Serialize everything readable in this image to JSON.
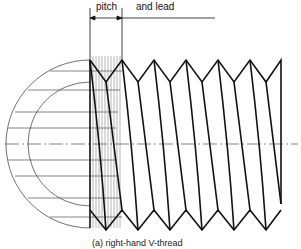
{
  "labels": {
    "pitch": "pitch",
    "and_lead": "and lead",
    "caption": "(a) right-hand V-thread"
  },
  "diagram": {
    "type": "single-start right-hand V-thread with helix projection",
    "colors": {
      "line": "#111111",
      "thin": "#333333",
      "background": "#ffffff"
    }
  }
}
